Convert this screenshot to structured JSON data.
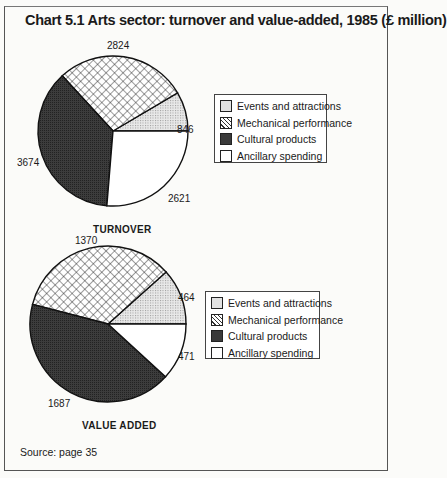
{
  "title": "Chart 5.1   Arts sector: turnover and value-added, 1985 (£ million)",
  "source": "Source: page 35",
  "legend_labels": [
    "Events and attractions",
    "Mechanical performance",
    "Cultural products",
    "Ancillary spending"
  ],
  "patterns": [
    "dots",
    "crosshatch",
    "dark",
    "white"
  ],
  "colors": {
    "dots": "#d9d9d9",
    "crosshatch": "#ffffff",
    "dark": "#3a3a3a",
    "white": "#ffffff",
    "outline": "#111111"
  },
  "turnover": {
    "title": "TURNOVER",
    "labels": [
      "846",
      "2824",
      "3674",
      "2621"
    ]
  },
  "value_added": {
    "title": "VALUE ADDED",
    "labels": [
      "464",
      "1370",
      "1687",
      "471"
    ]
  },
  "chart_data": [
    {
      "type": "pie",
      "title": "Chart 5.1 Arts sector: turnover and value-added, 1985 (£ million) — Turnover",
      "subtitle": "TURNOVER",
      "categories": [
        "Events and attractions",
        "Mechanical performance",
        "Cultural products",
        "Ancillary spending"
      ],
      "values": [
        846,
        2824,
        3674,
        2621
      ],
      "units": "£ million",
      "legend_position": "right"
    },
    {
      "type": "pie",
      "title": "Chart 5.1 Arts sector: turnover and value-added, 1985 (£ million) — Value added",
      "subtitle": "VALUE ADDED",
      "categories": [
        "Events and attractions",
        "Mechanical performance",
        "Cultural products",
        "Ancillary spending"
      ],
      "values": [
        464,
        1370,
        1687,
        471
      ],
      "units": "£ million",
      "legend_position": "right"
    }
  ]
}
